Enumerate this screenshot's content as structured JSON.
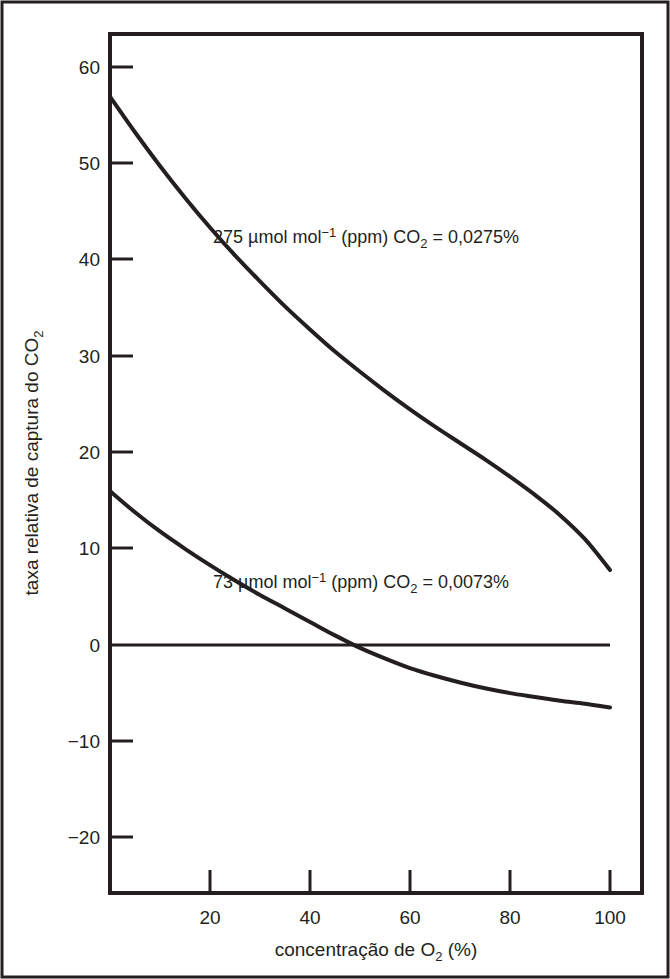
{
  "chart_data": {
    "type": "line",
    "title": "",
    "subtitle": "",
    "xlabel_plain": "concentração de O2 (%)",
    "ylabel_plain": "taxa relativa de captura do CO2",
    "xlabel_parts": {
      "before": "concentração de O",
      "sub": "2",
      "after": " (%)"
    },
    "ylabel_parts": {
      "before": "taxa relativa de captura do CO",
      "sub": "2",
      "after": ""
    },
    "xlim": [
      0,
      100
    ],
    "ylim": [
      -24,
      63
    ],
    "xticks": [
      20,
      40,
      60,
      80,
      100
    ],
    "xtick_labels": [
      "20",
      "40",
      "60",
      "80",
      "100"
    ],
    "yticks": [
      60,
      50,
      40,
      30,
      20,
      10,
      0,
      -10,
      -20
    ],
    "ytick_labels": [
      "60",
      "50",
      "40",
      "30",
      "20",
      "10",
      "0",
      "−10",
      "−20"
    ],
    "grid": false,
    "legend_position": "inline-annotation",
    "zero_reference_line": {
      "value": 0,
      "x_start": 0,
      "x_end": 100
    },
    "series": [
      {
        "name": "275 µmol mol−1 (ppm) CO2 = 0,0275%",
        "annotation_parts": {
          "before": "275 µmol mol",
          "sup": "−1",
          "mid": " (ppm) CO",
          "sub": "2",
          "after": " = 0,0275%"
        },
        "x": [
          0,
          5,
          10,
          15,
          20,
          25,
          30,
          35,
          40,
          45,
          50,
          55,
          60,
          65,
          70,
          75,
          80,
          85,
          90,
          95,
          100
        ],
        "values": [
          57.0,
          53.3,
          49.8,
          46.5,
          43.4,
          40.5,
          37.8,
          35.2,
          32.8,
          30.5,
          28.4,
          26.4,
          24.5,
          22.7,
          21.0,
          19.3,
          17.5,
          15.6,
          13.5,
          11.0,
          7.8
        ]
      },
      {
        "name": "73 µmol mol−1 (ppm) CO2 = 0,0073%",
        "annotation_parts": {
          "before": "73 µmol mol",
          "sup": "−1",
          "mid": " (ppm) CO",
          "sub": "2",
          "after": " = 0,0073%"
        },
        "x": [
          0,
          5,
          10,
          15,
          20,
          25,
          30,
          35,
          40,
          45,
          50,
          55,
          60,
          65,
          70,
          75,
          80,
          85,
          90,
          95,
          100
        ],
        "values": [
          16.0,
          13.8,
          11.8,
          10.0,
          8.3,
          6.7,
          5.2,
          3.8,
          2.4,
          1.0,
          -0.3,
          -1.4,
          -2.4,
          -3.2,
          -3.9,
          -4.5,
          -5.0,
          -5.4,
          -5.8,
          -6.1,
          -6.5
        ]
      }
    ],
    "colors": {
      "curve": "#231f20",
      "axis": "#231f20",
      "background": "#ffffff"
    }
  },
  "annotations": {
    "upper_curve_label": "275 µmol mol⁻¹ (ppm) CO₂ = 0,0275%",
    "lower_curve_label": "73 µmol mol⁻¹ (ppm) CO₂ = 0,0073%"
  }
}
